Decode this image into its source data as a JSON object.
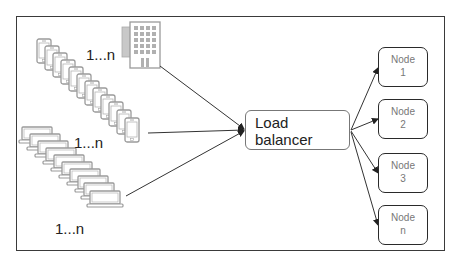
{
  "diagram": {
    "clients": {
      "buildings": {
        "label": "1...n",
        "icon": "office-building-icon"
      },
      "phones": {
        "label": "1...n",
        "icon": "smartphone-stack-icon",
        "count_drawn": 12
      },
      "laptops": {
        "label": "1...n",
        "icon": "laptop-stack-icon",
        "count_drawn": 10
      }
    },
    "load_balancer": {
      "line1": "Load",
      "line2": "balancer"
    },
    "nodes": [
      {
        "line1": "Node",
        "line2": "1"
      },
      {
        "line1": "Node",
        "line2": "2"
      },
      {
        "line1": "Node",
        "line2": "3"
      },
      {
        "line1": "Node",
        "line2": "n"
      }
    ],
    "colors": {
      "frame": "#3a3a3a",
      "arrow": "#333333",
      "device_stroke": "#9a9a9a",
      "node_text": "#777777"
    }
  }
}
